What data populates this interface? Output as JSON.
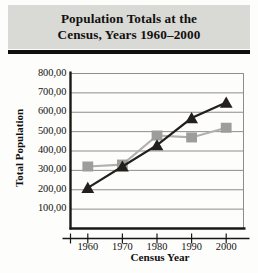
{
  "chart_data": {
    "type": "line",
    "title": "Population Totals at the Census, Years 1960–2000",
    "title_line1": "Population Totals at the",
    "title_line2": "Census, Years 1960–2000",
    "xlabel": "Census Year",
    "ylabel": "Total Population",
    "categories": [
      "1960",
      "1970",
      "1980",
      "1990",
      "2000"
    ],
    "x": [
      1960,
      1970,
      1980,
      1990,
      2000
    ],
    "xtick_labels": [
      "1960",
      "1970",
      "1980",
      "1990",
      "2000"
    ],
    "ytick_labels": [
      "100,00",
      "200,00",
      "300,00",
      "400,00",
      "500,00",
      "600,00",
      "700,00",
      "800,00"
    ],
    "ytick_values": [
      100000,
      200000,
      300000,
      400000,
      500000,
      600000,
      700000,
      800000
    ],
    "ylim": [
      0,
      800000
    ],
    "xlim": [
      1955,
      2005
    ],
    "grid": "horizontal",
    "legend": "none",
    "series": [
      {
        "name": "series-squares",
        "marker": "square",
        "color": "#9d9d99",
        "line_color": "#b0b0ac",
        "values": [
          320000,
          330000,
          480000,
          470000,
          520000
        ]
      },
      {
        "name": "series-triangles",
        "marker": "triangle",
        "color": "#221f1c",
        "line_color": "#221f1c",
        "values": [
          210000,
          320000,
          430000,
          570000,
          650000
        ]
      }
    ]
  },
  "style": {
    "banner_bg": "#d9d9d6",
    "rule_color": "#100f0d",
    "axis_color": "#1a1815",
    "grid_color": "#8d8d89",
    "page_bg": "#fdfdfc"
  }
}
